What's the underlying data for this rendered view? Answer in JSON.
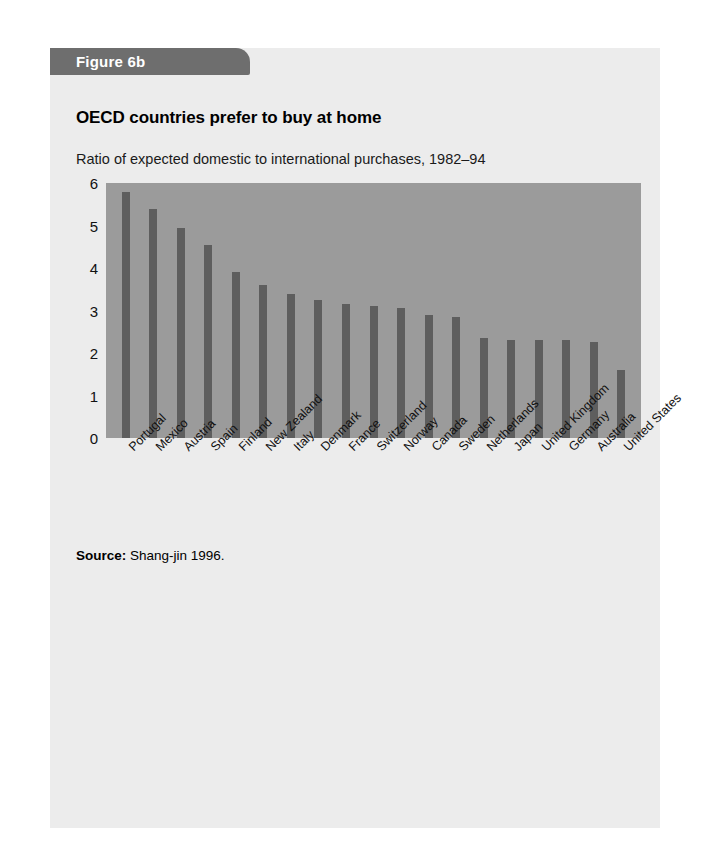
{
  "figure": {
    "tab_label": "Figure 6b",
    "tab_color": "#6e6e6e",
    "card_background": "#ececec",
    "page_background": "#ffffff"
  },
  "source": {
    "label": "Source:",
    "text": "Shang-jin 1996."
  },
  "chart_data": {
    "type": "bar",
    "title": "OECD countries prefer to buy at home",
    "subtitle": "Ratio of expected domestic to international purchases, 1982–94",
    "xlabel": "",
    "ylabel": "",
    "ylim": [
      0,
      6
    ],
    "yticks": [
      0,
      1,
      2,
      3,
      4,
      5,
      6
    ],
    "ytick_labels": [
      "0",
      "1",
      "2",
      "3",
      "4",
      "5",
      "6"
    ],
    "grid": false,
    "legend": false,
    "plot_background": "#9b9b9b",
    "bar_color": "#5e5e5e",
    "categories": [
      "Portugal",
      "Mexico",
      "Austria",
      "Spain",
      "Finland",
      "New Zealand",
      "Italy",
      "Denmark",
      "France",
      "Switzerland",
      "Norway",
      "Canada",
      "Sweden",
      "Netherlands",
      "Japan",
      "United Kingdom",
      "Germany",
      "Australia",
      "United States"
    ],
    "values": [
      5.8,
      5.4,
      4.95,
      4.55,
      3.9,
      3.6,
      3.4,
      3.25,
      3.15,
      3.1,
      3.05,
      2.9,
      2.85,
      2.35,
      2.3,
      2.3,
      2.3,
      2.25,
      1.6
    ]
  }
}
